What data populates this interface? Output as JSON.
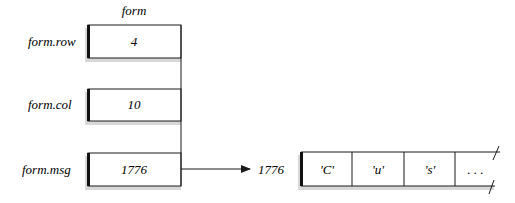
{
  "diagram": {
    "struct_name": "form",
    "fields": [
      {
        "label": "form.row",
        "value": "4"
      },
      {
        "label": "form.col",
        "value": "10"
      },
      {
        "label": "form.msg",
        "value": "1776"
      }
    ],
    "pointer_target": {
      "address_label": "1776",
      "cells": [
        "'C'",
        "'u'",
        "'s'",
        ". . ."
      ]
    }
  }
}
